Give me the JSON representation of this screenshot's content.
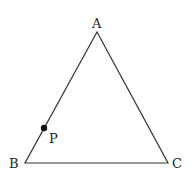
{
  "diagram": {
    "type": "triangle",
    "vertices": [
      {
        "label": "A",
        "x": 97,
        "y": 32
      },
      {
        "label": "B",
        "x": 25,
        "y": 163
      },
      {
        "label": "C",
        "x": 168,
        "y": 163
      }
    ],
    "point": {
      "label": "P",
      "x": 44,
      "y": 128,
      "on_segment": "AB"
    },
    "stroke_color": "#333333"
  }
}
